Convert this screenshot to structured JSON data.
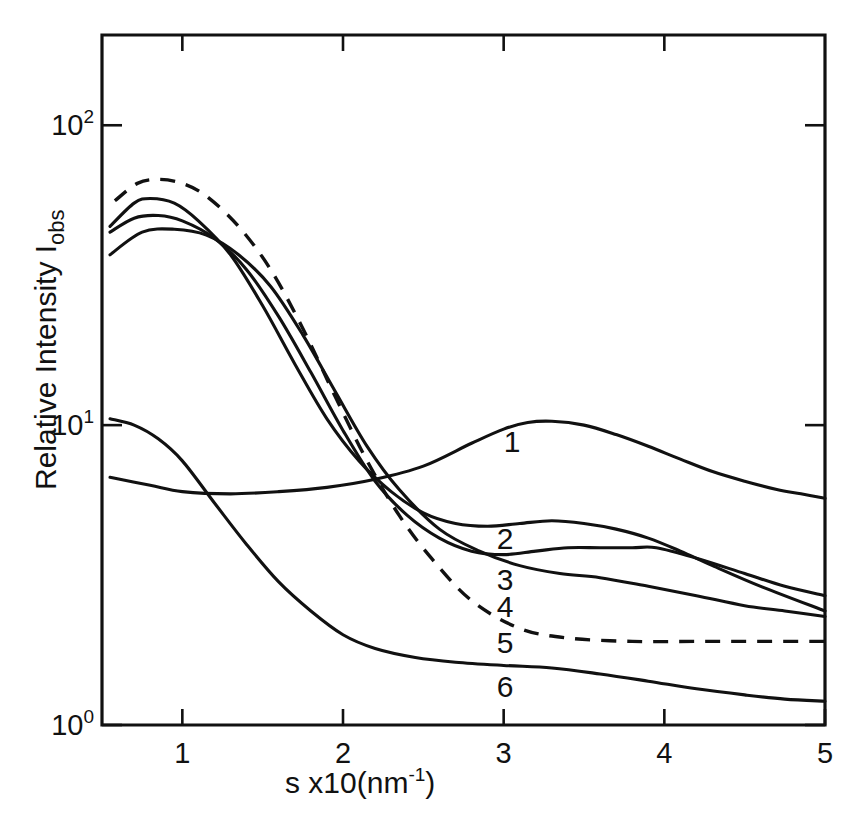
{
  "figure": {
    "background_color": "#ffffff",
    "ink_color": "#111111"
  },
  "axes": {
    "x_title_main": "s x10(nm",
    "x_title_exponent": "-1",
    "x_title_close": ")",
    "y_title_main": "Relative Intensity I",
    "y_title_subscript": "obs",
    "x_tick_labels": [
      "1",
      "2",
      "3",
      "4",
      "5"
    ],
    "y_tick_labels": [
      {
        "mantissa": "10",
        "exponent": "2"
      },
      {
        "mantissa": "10",
        "exponent": "1"
      },
      {
        "mantissa": "10",
        "exponent": "0"
      }
    ]
  },
  "curve_labels": [
    {
      "text": "1",
      "x": 512,
      "y": 452
    },
    {
      "text": "2",
      "x": 505,
      "y": 549
    },
    {
      "text": "3",
      "x": 505,
      "y": 590
    },
    {
      "text": "4",
      "x": 505,
      "y": 617
    },
    {
      "text": "5",
      "x": 505,
      "y": 653
    },
    {
      "text": "6",
      "x": 505,
      "y": 697
    }
  ],
  "chart_data": {
    "type": "line",
    "title": "",
    "xlabel": "s x10(nm^-1)",
    "ylabel": "Relative Intensity Iobs",
    "xlim": [
      0.5,
      5.0
    ],
    "ylim": [
      1.0,
      200.0
    ],
    "yscale": "log",
    "xscale": "linear",
    "grid": false,
    "legend": "inline curve numbers 1-6",
    "x_ticks": [
      1,
      2,
      3,
      4,
      5
    ],
    "y_ticks": [
      1,
      10,
      100
    ],
    "series": [
      {
        "name": "1",
        "style": "solid",
        "x": [
          0.55,
          0.8,
          1.0,
          1.3,
          1.6,
          1.9,
          2.2,
          2.5,
          2.8,
          3.0,
          3.15,
          3.3,
          3.5,
          3.7,
          3.9,
          4.1,
          4.3,
          4.5,
          4.7,
          4.85,
          5.0
        ],
        "y": [
          6.7,
          6.3,
          6.0,
          5.9,
          6.0,
          6.2,
          6.6,
          7.3,
          8.7,
          9.7,
          10.2,
          10.3,
          10.0,
          9.3,
          8.5,
          7.7,
          7.0,
          6.5,
          6.1,
          5.9,
          5.7
        ]
      },
      {
        "name": "2",
        "style": "solid",
        "x": [
          0.55,
          0.7,
          0.8,
          0.95,
          1.1,
          1.3,
          1.5,
          1.7,
          1.9,
          2.1,
          2.3,
          2.5,
          2.7,
          2.9,
          3.1,
          3.3,
          3.5,
          3.7,
          3.9,
          4.1,
          4.3,
          4.6,
          5.0
        ],
        "y": [
          46,
          55,
          57,
          55,
          48,
          37,
          25,
          16,
          10.5,
          7.6,
          6.0,
          5.1,
          4.7,
          4.6,
          4.7,
          4.8,
          4.7,
          4.5,
          4.2,
          3.8,
          3.4,
          2.9,
          2.4
        ]
      },
      {
        "name": "3",
        "style": "solid",
        "x": [
          0.55,
          0.7,
          0.85,
          1.0,
          1.2,
          1.4,
          1.6,
          1.8,
          2.0,
          2.2,
          2.4,
          2.6,
          2.8,
          3.0,
          3.2,
          3.4,
          3.6,
          3.8,
          3.95,
          4.2,
          4.5,
          4.75,
          5.0
        ],
        "y": [
          44,
          49,
          50,
          48,
          42,
          33,
          23,
          15,
          9.6,
          6.5,
          5.0,
          4.2,
          3.8,
          3.7,
          3.8,
          3.9,
          3.9,
          3.9,
          3.9,
          3.6,
          3.2,
          2.9,
          2.7
        ]
      },
      {
        "name": "4",
        "style": "solid",
        "x": [
          0.55,
          0.75,
          0.95,
          1.15,
          1.35,
          1.55,
          1.75,
          1.95,
          2.15,
          2.35,
          2.6,
          2.85,
          3.1,
          3.35,
          3.6,
          3.9,
          4.2,
          4.5,
          4.75,
          5.0
        ],
        "y": [
          37,
          44,
          45,
          43,
          37,
          29,
          20,
          13,
          8.5,
          6.1,
          4.5,
          3.8,
          3.4,
          3.2,
          3.1,
          2.9,
          2.7,
          2.5,
          2.4,
          2.3
        ]
      },
      {
        "name": "5",
        "style": "dashed",
        "x": [
          0.58,
          0.72,
          0.85,
          1.0,
          1.15,
          1.35,
          1.55,
          1.75,
          1.95,
          2.15,
          2.35,
          2.55,
          2.8,
          3.1,
          3.4,
          3.8,
          4.2,
          4.6,
          5.0
        ],
        "y": [
          56,
          64,
          66,
          64,
          58,
          46,
          33,
          21,
          12.5,
          7.6,
          5.0,
          3.6,
          2.6,
          2.1,
          1.95,
          1.9,
          1.9,
          1.9,
          1.9
        ]
      },
      {
        "name": "6",
        "style": "solid",
        "x": [
          0.55,
          0.7,
          0.85,
          1.0,
          1.2,
          1.4,
          1.6,
          1.8,
          2.0,
          2.2,
          2.45,
          2.7,
          3.0,
          3.3,
          3.6,
          3.9,
          4.2,
          4.5,
          4.75,
          5.0
        ],
        "y": [
          10.5,
          10.0,
          9.0,
          7.6,
          5.5,
          4.0,
          3.0,
          2.4,
          2.0,
          1.8,
          1.68,
          1.62,
          1.58,
          1.55,
          1.48,
          1.4,
          1.32,
          1.26,
          1.22,
          1.2
        ]
      }
    ]
  }
}
